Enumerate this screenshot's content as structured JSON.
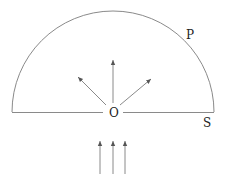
{
  "diagram": {
    "labels": {
      "center": "O",
      "arc_point": "P",
      "base_point": "S"
    },
    "shapes": {
      "semicircle": {
        "cx": 113,
        "cy": 112,
        "r": 101
      },
      "emitted_arrows": [
        {
          "direction": "upper-left"
        },
        {
          "direction": "up"
        },
        {
          "direction": "upper-right"
        }
      ],
      "incoming_arrows": [
        {
          "direction": "up"
        },
        {
          "direction": "up"
        },
        {
          "direction": "up"
        }
      ]
    },
    "colors": {
      "stroke": "#8a8a8a",
      "text": "#222222"
    }
  }
}
